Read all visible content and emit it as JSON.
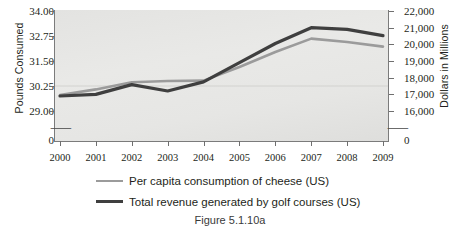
{
  "caption": "Figure 5.1.10a",
  "colors": {
    "series_cheese": "#9b9b9b",
    "series_golf": "#3f3f3f",
    "plot_background": "#e6e6e4",
    "axis": "#7b7b7b",
    "text": "#231f20"
  },
  "axes": {
    "left": {
      "title": "Pounds Consumed",
      "ticks": [
        "34.00",
        "32.75",
        "31.50",
        "30.25",
        "29.00",
        "0"
      ],
      "break_symbol": "⸺"
    },
    "right": {
      "title": "Dollars in Millions",
      "ticks": [
        "22,000",
        "21,000",
        "20,000",
        "19,000",
        "18,000",
        "17,000",
        "16,000",
        "0"
      ],
      "break_symbol": "⸺"
    },
    "bottom": {
      "ticks": [
        "2000",
        "2001",
        "2002",
        "2003",
        "2004",
        "2005",
        "2006",
        "2007",
        "2008",
        "2009"
      ]
    }
  },
  "legend": {
    "items": [
      {
        "label": "Per capita consumption of cheese (US)",
        "color": "#9b9b9b",
        "width": 2.6
      },
      {
        "label": "Total revenue generated by golf courses (US)",
        "color": "#3f3f3f",
        "width": 3.4
      }
    ]
  },
  "chart_data": {
    "type": "line",
    "title": "",
    "subtitle": "",
    "xlabel": "",
    "ylabel": "Pounds Consumed",
    "y2label": "Dollars in Millions",
    "grid": false,
    "legend_position": "bottom",
    "x": [
      2000,
      2001,
      2002,
      2003,
      2004,
      2005,
      2006,
      2007,
      2008,
      2009
    ],
    "xlim": [
      2000,
      2009
    ],
    "ylim": [
      29.0,
      34.0
    ],
    "y2lim": [
      16000,
      22000
    ],
    "y_break": true,
    "y2_break": true,
    "series": [
      {
        "name": "Per capita consumption of cheese (US)",
        "axis": "left",
        "units": "pounds",
        "color": "#9b9b9b",
        "values": [
          29.8,
          30.08,
          30.44,
          30.5,
          30.52,
          31.2,
          31.95,
          32.62,
          32.45,
          32.22
        ]
      },
      {
        "name": "Total revenue generated by golf courses (US)",
        "axis": "right",
        "units": "millions of dollars",
        "color": "#3f3f3f",
        "values": [
          16900,
          17000,
          17580,
          17200,
          17750,
          18900,
          20050,
          21000,
          20900,
          20520
        ]
      }
    ]
  }
}
